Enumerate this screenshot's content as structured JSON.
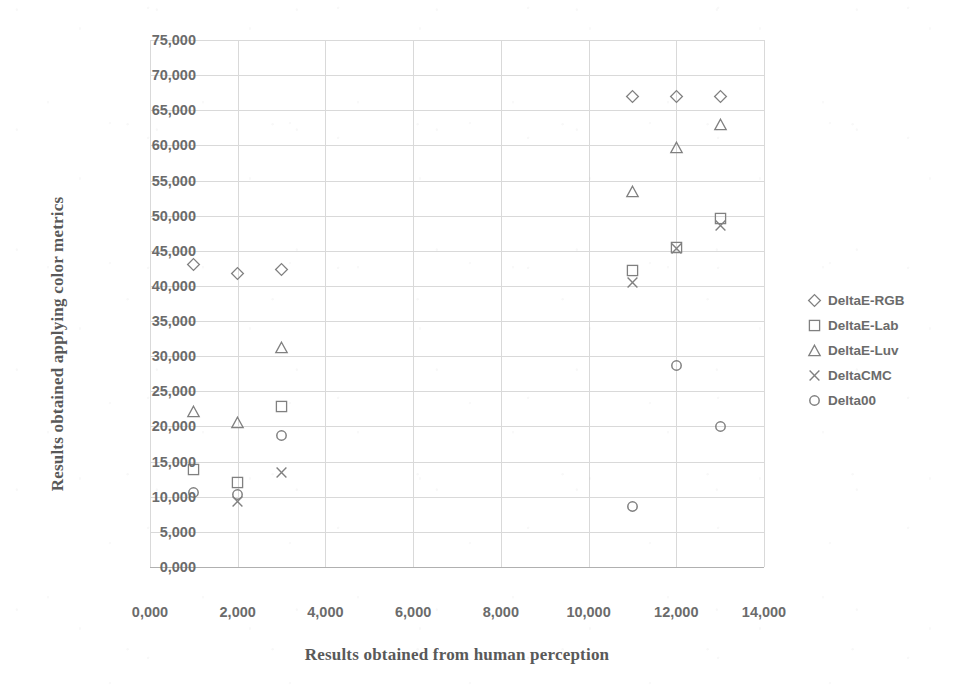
{
  "chart_data": {
    "type": "scatter",
    "title": "",
    "xlabel": "Results obtained from human perception",
    "ylabel": "Results obtained applying color metrics",
    "xlim": [
      0,
      14000
    ],
    "ylim": [
      0,
      75000
    ],
    "xticks": [
      "0,000",
      "2,000",
      "4,000",
      "6,000",
      "8,000",
      "10,000",
      "12,000",
      "14,000"
    ],
    "xtick_values": [
      0,
      2000,
      4000,
      6000,
      8000,
      10000,
      12000,
      14000
    ],
    "yticks": [
      "0,000",
      "5,000",
      "10,000",
      "15,000",
      "20,000",
      "25,000",
      "30,000",
      "35,000",
      "40,000",
      "45,000",
      "50,000",
      "55,000",
      "60,000",
      "65,000",
      "70,000",
      "75,000"
    ],
    "ytick_values": [
      0,
      5000,
      10000,
      15000,
      20000,
      25000,
      30000,
      35000,
      40000,
      45000,
      50000,
      55000,
      60000,
      65000,
      70000,
      75000
    ],
    "grid": true,
    "legend_position": "right",
    "marker_color": "#808080",
    "grid_color": "#d9d9d9",
    "series": [
      {
        "name": "DeltaE-RGB",
        "marker": "diamond",
        "points": [
          {
            "x": 1000,
            "y": 43000
          },
          {
            "x": 2000,
            "y": 41700
          },
          {
            "x": 3000,
            "y": 42400
          },
          {
            "x": 11000,
            "y": 67000
          },
          {
            "x": 12000,
            "y": 67000
          },
          {
            "x": 13000,
            "y": 67000
          }
        ]
      },
      {
        "name": "DeltaE-Lab",
        "marker": "square",
        "points": [
          {
            "x": 1000,
            "y": 13900
          },
          {
            "x": 2000,
            "y": 12000
          },
          {
            "x": 3000,
            "y": 22900
          },
          {
            "x": 11000,
            "y": 42200
          },
          {
            "x": 12000,
            "y": 45500
          },
          {
            "x": 13000,
            "y": 49600
          }
        ]
      },
      {
        "name": "DeltaE-Luv",
        "marker": "triangle",
        "points": [
          {
            "x": 1000,
            "y": 22200
          },
          {
            "x": 2000,
            "y": 20600
          },
          {
            "x": 3000,
            "y": 31200
          },
          {
            "x": 11000,
            "y": 53500
          },
          {
            "x": 12000,
            "y": 59700
          },
          {
            "x": 13000,
            "y": 63000
          }
        ]
      },
      {
        "name": "DeltaCMC",
        "marker": "cross",
        "points": [
          {
            "x": 2000,
            "y": 9300
          },
          {
            "x": 3000,
            "y": 13500
          },
          {
            "x": 11000,
            "y": 40500
          },
          {
            "x": 12000,
            "y": 45300
          },
          {
            "x": 13000,
            "y": 48600
          }
        ]
      },
      {
        "name": "Delta00",
        "marker": "circle",
        "points": [
          {
            "x": 1000,
            "y": 10600
          },
          {
            "x": 2000,
            "y": 10300
          },
          {
            "x": 3000,
            "y": 18700
          },
          {
            "x": 11000,
            "y": 8600
          },
          {
            "x": 12000,
            "y": 28700
          },
          {
            "x": 13000,
            "y": 20000
          }
        ]
      }
    ]
  }
}
